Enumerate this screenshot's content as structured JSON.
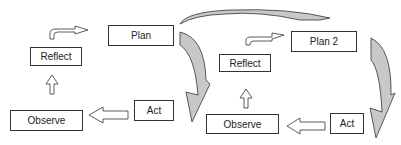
{
  "diagram": {
    "colors": {
      "stroke": "#333333",
      "fill_gray": "#c8c8c8",
      "background": "#ffffff"
    },
    "cycle1": {
      "plan": "Plan",
      "act": "Act",
      "observe": "Observe",
      "reflect": "Reflect"
    },
    "cycle2": {
      "plan": "Plan 2",
      "act": "Act",
      "observe": "Observe",
      "reflect": "Reflect"
    }
  }
}
